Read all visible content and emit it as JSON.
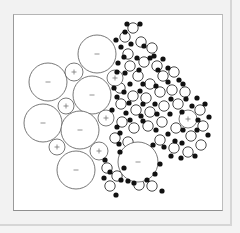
{
  "diagram": {
    "title": "",
    "colors": {
      "background": "#f2f2f2",
      "frame": "#ffffff",
      "outline": "#555555",
      "atom": "#111111"
    },
    "large_ions": [
      {
        "cx": 97,
        "cy": 54,
        "r": 19,
        "sign": "-"
      },
      {
        "cx": 48,
        "cy": 82,
        "r": 19,
        "sign": "-"
      },
      {
        "cx": 92,
        "cy": 95,
        "r": 19,
        "sign": "-"
      },
      {
        "cx": 43,
        "cy": 123,
        "r": 19,
        "sign": "-"
      },
      {
        "cx": 80,
        "cy": 130,
        "r": 19,
        "sign": "-"
      },
      {
        "cx": 76,
        "cy": 170,
        "r": 19,
        "sign": "-"
      },
      {
        "cx": 138,
        "cy": 162,
        "r": 20,
        "sign": "-"
      },
      {
        "cx": 74,
        "cy": 72,
        "r": 9,
        "sign": "+"
      },
      {
        "cx": 66,
        "cy": 106,
        "r": 8,
        "sign": "+"
      },
      {
        "cx": 57,
        "cy": 147,
        "r": 8,
        "sign": "+"
      },
      {
        "cx": 99,
        "cy": 151,
        "r": 9,
        "sign": "+"
      },
      {
        "cx": 115,
        "cy": 78,
        "r": 8,
        "sign": "+"
      },
      {
        "cx": 106,
        "cy": 118,
        "r": 8,
        "sign": "+"
      },
      {
        "cx": 188,
        "cy": 119,
        "r": 9,
        "sign": "+"
      }
    ],
    "small_circles": [
      [
        133,
        28
      ],
      [
        125,
        37
      ],
      [
        141,
        42
      ],
      [
        152,
        48
      ],
      [
        128,
        54
      ],
      [
        144,
        62
      ],
      [
        157,
        66
      ],
      [
        130,
        66
      ],
      [
        120,
        88
      ],
      [
        138,
        76
      ],
      [
        150,
        84
      ],
      [
        163,
        76
      ],
      [
        174,
        72
      ],
      [
        133,
        96
      ],
      [
        146,
        98
      ],
      [
        160,
        92
      ],
      [
        172,
        90
      ],
      [
        185,
        92
      ],
      [
        121,
        104
      ],
      [
        136,
        110
      ],
      [
        150,
        112
      ],
      [
        164,
        106
      ],
      [
        178,
        104
      ],
      [
        200,
        110
      ],
      [
        122,
        122
      ],
      [
        134,
        128
      ],
      [
        148,
        126
      ],
      [
        162,
        122
      ],
      [
        176,
        128
      ],
      [
        203,
        126
      ],
      [
        191,
        136
      ],
      [
        115,
        138
      ],
      [
        128,
        142
      ],
      [
        160,
        140
      ],
      [
        174,
        148
      ],
      [
        188,
        152
      ],
      [
        152,
        186
      ],
      [
        139,
        185
      ],
      [
        117,
        176
      ],
      [
        201,
        145
      ],
      [
        107,
        168
      ],
      [
        110,
        186
      ]
    ],
    "atoms": [
      [
        127,
        24
      ],
      [
        140,
        24
      ],
      [
        125,
        32
      ],
      [
        131,
        44
      ],
      [
        144,
        46
      ],
      [
        116,
        40
      ],
      [
        121,
        47
      ],
      [
        124,
        57
      ],
      [
        118,
        63
      ],
      [
        137,
        58
      ],
      [
        150,
        58
      ],
      [
        154,
        56
      ],
      [
        163,
        59
      ],
      [
        117,
        72
      ],
      [
        125,
        73
      ],
      [
        139,
        70
      ],
      [
        158,
        70
      ],
      [
        168,
        68
      ],
      [
        179,
        80
      ],
      [
        130,
        84
      ],
      [
        143,
        84
      ],
      [
        114,
        88
      ],
      [
        124,
        92
      ],
      [
        140,
        91
      ],
      [
        156,
        86
      ],
      [
        168,
        82
      ],
      [
        183,
        84
      ],
      [
        197,
        98
      ],
      [
        117,
        97
      ],
      [
        129,
        103
      ],
      [
        143,
        104
      ],
      [
        155,
        104
      ],
      [
        171,
        99
      ],
      [
        186,
        99
      ],
      [
        205,
        104
      ],
      [
        192,
        106
      ],
      [
        126,
        113
      ],
      [
        141,
        116
      ],
      [
        157,
        114
      ],
      [
        170,
        114
      ],
      [
        182,
        112
      ],
      [
        209,
        117
      ],
      [
        198,
        120
      ],
      [
        112,
        110
      ],
      [
        117,
        127
      ],
      [
        130,
        120
      ],
      [
        143,
        121
      ],
      [
        156,
        130
      ],
      [
        168,
        134
      ],
      [
        183,
        130
      ],
      [
        197,
        130
      ],
      [
        208,
        135
      ],
      [
        120,
        133
      ],
      [
        119,
        144
      ],
      [
        153,
        145
      ],
      [
        164,
        147
      ],
      [
        182,
        143
      ],
      [
        175,
        141
      ],
      [
        195,
        156
      ],
      [
        120,
        152
      ],
      [
        124,
        168
      ],
      [
        121,
        180
      ],
      [
        128,
        181
      ],
      [
        134,
        183
      ],
      [
        147,
        180
      ],
      [
        155,
        174
      ],
      [
        160,
        164
      ],
      [
        171,
        156
      ],
      [
        181,
        158
      ],
      [
        105,
        160
      ],
      [
        110,
        172
      ],
      [
        104,
        178
      ],
      [
        116,
        195
      ],
      [
        162,
        191
      ]
    ]
  }
}
